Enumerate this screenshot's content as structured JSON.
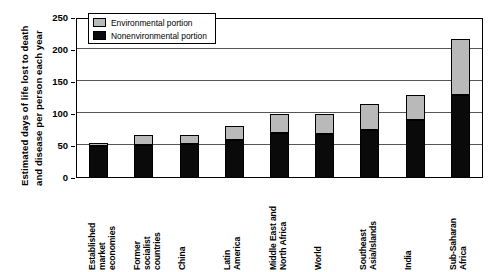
{
  "chart_data": {
    "type": "bar",
    "stacked": true,
    "title": "",
    "subtitle": "",
    "xlabel": "",
    "ylabel": "Estimated days of life lost to death and disease per person each year",
    "ylabel_lines": [
      "Estimated days of life lost to death",
      "and disease per person each year"
    ],
    "ylim": [
      0,
      250
    ],
    "yticks": [
      0,
      50,
      100,
      150,
      200,
      250
    ],
    "ytick_labels": [
      "0",
      "50",
      "100",
      "150",
      "200",
      "250"
    ],
    "grid": "horizontal",
    "legend_position": "top-left-inside",
    "categories": [
      "Established market economies",
      "Former socialist countries",
      "China",
      "Latin America",
      "Middle East and North Africa",
      "World",
      "Southeast Asia/Islands",
      "India",
      "Sub-Saharan Africa"
    ],
    "category_lines": [
      [
        "Established",
        "market",
        "economies"
      ],
      [
        "Former",
        "socialist",
        "countries"
      ],
      [
        "China"
      ],
      [
        "Latin",
        "America"
      ],
      [
        "Middle East and",
        "North Africa"
      ],
      [
        "World"
      ],
      [
        "Southeast",
        "Asia/Islands"
      ],
      [
        "India"
      ],
      [
        "Sub-Saharan",
        "Africa"
      ]
    ],
    "series": [
      {
        "name": "Nonenvironmental portion",
        "color": "#0a0a0a",
        "values": [
          50,
          52,
          53,
          60,
          70,
          68,
          75,
          90,
          130
        ]
      },
      {
        "name": "Environmental portion",
        "color": "#b9b9b9",
        "values": [
          5,
          15,
          15,
          22,
          30,
          32,
          40,
          40,
          88
        ]
      }
    ],
    "totals": [
      55,
      67,
      68,
      82,
      100,
      100,
      115,
      130,
      218
    ]
  },
  "legend": {
    "items": [
      {
        "label": "Environmental portion",
        "color": "#b9b9b9"
      },
      {
        "label": "Nonenvironmental portion",
        "color": "#0a0a0a"
      }
    ]
  },
  "colors": {
    "environmental": "#b9b9b9",
    "nonenvironmental": "#0a0a0a",
    "axis": "#000000",
    "grid": "#555555",
    "background": "#ffffff"
  }
}
